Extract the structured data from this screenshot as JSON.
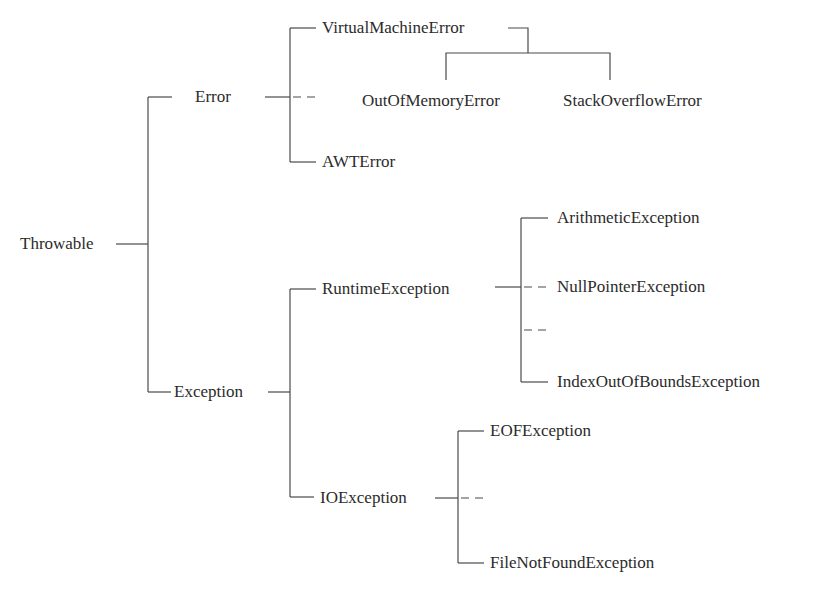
{
  "diagram": {
    "type": "class-hierarchy-tree",
    "root": "Throwable",
    "nodes": {
      "throwable": "Throwable",
      "error": "Error",
      "virtual_machine_error": "VirtualMachineError",
      "out_of_memory_error": "OutOfMemoryError",
      "stack_overflow_error": "StackOverflowError",
      "awt_error": "AWTError",
      "exception": "Exception",
      "runtime_exception": "RuntimeException",
      "arithmetic_exception": "ArithmeticException",
      "null_pointer_exception": "NullPointerException",
      "index_out_of_bounds_exception": "IndexOutOfBoundsException",
      "io_exception": "IOException",
      "eof_exception": "EOFException",
      "file_not_found_exception": "FileNotFoundException"
    },
    "edges": [
      {
        "from": "Throwable",
        "to": "Error"
      },
      {
        "from": "Throwable",
        "to": "Exception"
      },
      {
        "from": "Error",
        "to": "VirtualMachineError"
      },
      {
        "from": "Error",
        "to": "AWTError"
      },
      {
        "from": "Error",
        "to": "...",
        "style": "dashed"
      },
      {
        "from": "VirtualMachineError",
        "to": "OutOfMemoryError"
      },
      {
        "from": "VirtualMachineError",
        "to": "StackOverflowError"
      },
      {
        "from": "Exception",
        "to": "RuntimeException"
      },
      {
        "from": "Exception",
        "to": "IOException"
      },
      {
        "from": "RuntimeException",
        "to": "ArithmeticException"
      },
      {
        "from": "RuntimeException",
        "to": "NullPointerException",
        "style": "dashed"
      },
      {
        "from": "RuntimeException",
        "to": "...",
        "style": "dashed"
      },
      {
        "from": "RuntimeException",
        "to": "IndexOutOfBoundsException"
      },
      {
        "from": "IOException",
        "to": "EOFException"
      },
      {
        "from": "IOException",
        "to": "...",
        "style": "dashed"
      },
      {
        "from": "IOException",
        "to": "FileNotFoundException"
      }
    ],
    "colors": {
      "line": "#4a4a4a",
      "text": "#2b2b2b",
      "background": "#ffffff"
    }
  }
}
